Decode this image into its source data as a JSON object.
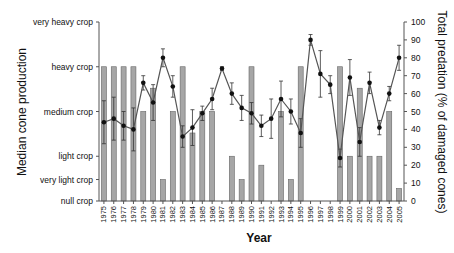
{
  "chart_data": {
    "type": "bar+line",
    "title": "",
    "xlabel": "Year",
    "ylabel_left": "Median cone production",
    "ylabel_right": "Total predation (% of damaged cones)",
    "left_ticks": [
      {
        "label": "null crop",
        "value": 0
      },
      {
        "label": "very light crop",
        "value": 12
      },
      {
        "label": "light crop",
        "value": 25
      },
      {
        "label": "medium crop",
        "value": 50
      },
      {
        "label": "heavy crop",
        "value": 75
      },
      {
        "label": "very heavy crop",
        "value": 100
      }
    ],
    "right_ticks": [
      0,
      10,
      20,
      30,
      40,
      50,
      60,
      70,
      80,
      90,
      100
    ],
    "ylim": [
      0,
      100
    ],
    "categories": [
      "1975",
      "1976",
      "1977",
      "1978",
      "1979",
      "1980",
      "1981",
      "1982",
      "1983",
      "1984",
      "1985",
      "1986",
      "1987",
      "1988",
      "1989",
      "1990",
      "1991",
      "1992",
      "1993",
      "1994",
      "1995",
      "1996",
      "1997",
      "1998",
      "1999",
      "2000",
      "2001",
      "2002",
      "2003",
      "2004",
      "2005"
    ],
    "series": [
      {
        "name": "Median cone production",
        "type": "bar",
        "axis": "left",
        "color": "#a6a6a6",
        "values": [
          75,
          75,
          75,
          75,
          50,
          63,
          12,
          50,
          75,
          38,
          50,
          50,
          0,
          25,
          12,
          75,
          20,
          0,
          50,
          12,
          75,
          0,
          0,
          0,
          75,
          25,
          63,
          25,
          25,
          50,
          7
        ]
      },
      {
        "name": "Total predation (% of damaged cones)",
        "type": "line",
        "axis": "right",
        "color": "#222222",
        "values": [
          44,
          46,
          42,
          40,
          66,
          55,
          80,
          64,
          36,
          41,
          49,
          57,
          74,
          60,
          52,
          49,
          42,
          46,
          57,
          50,
          38,
          90,
          71,
          65,
          24,
          69,
          33,
          66,
          41,
          60,
          80
        ],
        "errors": [
          12,
          12,
          8,
          12,
          4,
          10,
          5,
          6,
          6,
          10,
          4,
          6,
          1,
          6,
          7,
          6,
          6,
          11,
          10,
          7,
          8,
          3,
          13,
          5,
          5,
          10,
          8,
          6,
          4,
          4,
          7
        ]
      }
    ],
    "grid": false,
    "legend": "none"
  }
}
